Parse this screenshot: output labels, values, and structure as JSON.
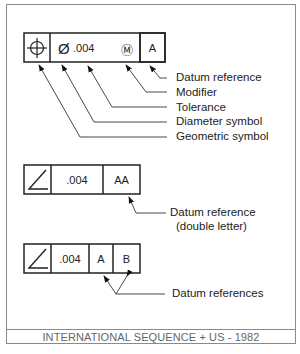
{
  "frame1": {
    "symbol": "position-icon",
    "diameter": "Ø",
    "tolerance": ".004",
    "modifier": "Ⓜ",
    "datum": "A",
    "labels": [
      "Datum reference",
      "Modifier",
      "Tolerance",
      "Diameter symbol",
      "Geometric symbol"
    ]
  },
  "frame2": {
    "symbol": "angularity-icon",
    "tolerance": ".004",
    "datum": "AA",
    "label_line1": "Datum reference",
    "label_line2": "(double letter)"
  },
  "frame3": {
    "symbol": "angularity-icon",
    "tolerance": ".004",
    "datum1": "A",
    "datum2": "B",
    "label": "Datum references"
  },
  "footer": "INTERNATIONAL SEQUENCE + US - 1982"
}
